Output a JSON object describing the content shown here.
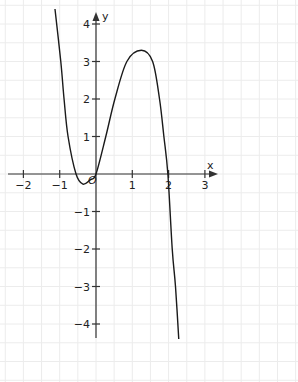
{
  "chart_data": {
    "type": "line",
    "title": "",
    "xlabel": "x",
    "ylabel": "y",
    "origin_label": "O",
    "xlim": [
      -2.6,
      3.4
    ],
    "ylim": [
      -4.6,
      4.5
    ],
    "grid": true,
    "grid_step": 0.5,
    "x_ticks": [
      -2,
      -1,
      1,
      2,
      3
    ],
    "x_tick_labels": [
      "−2",
      "−1",
      "1",
      "2",
      "3"
    ],
    "y_ticks": [
      4,
      3,
      2,
      1,
      -1,
      -2,
      -3,
      -4
    ],
    "y_tick_labels": [
      "4",
      "3",
      "2",
      "1",
      "−1",
      "−2",
      "−3",
      "−4"
    ],
    "series": [
      {
        "name": "f(x)",
        "x": [
          -1.13,
          -0.97,
          -0.88,
          -0.77,
          -0.55,
          -0.36,
          -0.15,
          0,
          0.27,
          0.52,
          0.85,
          1.25,
          1.56,
          1.75,
          1.87,
          1.98,
          2.1,
          2.19,
          2.28
        ],
        "y": [
          4.4,
          3.0,
          2.0,
          1.0,
          0.0,
          -0.27,
          -0.15,
          0.0,
          1.0,
          2.0,
          3.0,
          3.3,
          3.0,
          2.0,
          1.0,
          0.0,
          -2.0,
          -3.0,
          -4.4
        ]
      }
    ]
  },
  "colors": {
    "curve": "#1a1a1a",
    "axis": "#333333",
    "grid": "#ececec"
  }
}
